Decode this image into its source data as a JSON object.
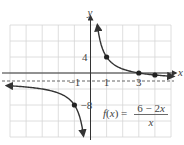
{
  "chart_data": {
    "type": "line",
    "title": "",
    "function_label": "f(x) =",
    "numerator": "6 − 2x",
    "denominator": "x",
    "xlabel": "x",
    "ylabel": "y",
    "xlim": [
      -5,
      5
    ],
    "ylim": [
      -16,
      12
    ],
    "grid": true,
    "x_grid_step": 1,
    "y_grid_step": 4,
    "tick_labels": {
      "x": [
        {
          "value": -1,
          "label": "−1"
        },
        {
          "value": 1,
          "label": "1"
        },
        {
          "value": 3,
          "label": "3"
        }
      ],
      "y": [
        {
          "value": 4,
          "label": "4"
        },
        {
          "value": -8,
          "label": "−8"
        }
      ]
    },
    "asymptotes": {
      "vertical": 0,
      "horizontal": -2
    },
    "series": [
      {
        "name": "f(x) = (6 − 2x)/x",
        "branch": "right",
        "x": [
          0.45,
          0.6,
          0.8,
          1,
          1.5,
          2,
          2.5,
          3,
          3.5,
          4,
          4.5,
          5
        ],
        "y": [
          11.33,
          8,
          5.5,
          4,
          2,
          1,
          0.4,
          0,
          -0.29,
          -0.5,
          -0.67,
          -0.8
        ]
      },
      {
        "name": "f(x) = (6 − 2x)/x",
        "branch": "left",
        "x": [
          -5,
          -4,
          -3,
          -2,
          -1.5,
          -1,
          -0.8,
          -0.6,
          -0.5,
          -0.44
        ],
        "y": [
          -3.2,
          -3.5,
          -4,
          -5,
          -6,
          -8,
          -9.5,
          -12,
          -14,
          -15.6
        ]
      }
    ],
    "marked_points": [
      {
        "x": 1,
        "y": 4
      },
      {
        "x": 3,
        "y": 0
      },
      {
        "x": 4,
        "y": -0.5
      },
      {
        "x": -1,
        "y": -8
      }
    ]
  },
  "colors": {
    "grid": "#d6d6d6",
    "axis": "#333333",
    "curve": "#333333",
    "asymptote": "#666666",
    "text": "#444444"
  }
}
